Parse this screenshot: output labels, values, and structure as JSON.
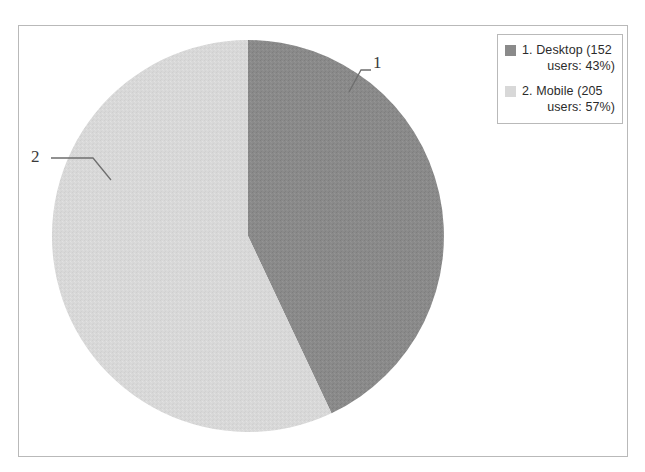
{
  "chart_data": {
    "type": "pie",
    "title": "",
    "categories": [
      "Desktop",
      "Mobile"
    ],
    "values": [
      43,
      57
    ],
    "counts": [
      152,
      205
    ],
    "value_unit": "%",
    "count_unit": "users",
    "total_users": 357,
    "start_angle_deg": 0,
    "direction": "clockwise",
    "grid": false,
    "legend_position": "top-right",
    "colors": [
      "#8a8a8a",
      "#d8d8d8"
    ],
    "slices": [
      {
        "index": 1,
        "label": "Desktop",
        "count": 152,
        "percent": 43,
        "color": "#8a8a8a",
        "callout": "1"
      },
      {
        "index": 2,
        "label": "Mobile",
        "count": 205,
        "percent": 57,
        "color": "#d8d8d8",
        "callout": "2"
      }
    ]
  },
  "legend": {
    "entries": [
      {
        "swatch_color": "#8a8a8a",
        "line1": "1. Desktop (152",
        "line2": "users: 43%)"
      },
      {
        "swatch_color": "#d8d8d8",
        "line1": "2. Mobile (205",
        "line2": "users: 57%)"
      }
    ]
  },
  "callouts": {
    "slice1": "1",
    "slice2": "2"
  },
  "style": {
    "frame_border": "#b9b9b9",
    "background": "#ffffff",
    "leader_line": "#6e6e6e",
    "text": "#2b2b2b"
  }
}
